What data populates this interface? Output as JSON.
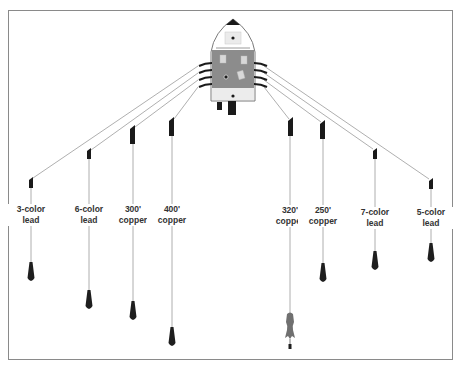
{
  "diagram": {
    "title": "",
    "colors": {
      "line": "#9a9a9a",
      "weight": "#1e1e1e",
      "board": "#1a1a1a",
      "boat_hull": "#ffffff",
      "boat_deck": "#8c8c8c",
      "border": "#8a8a8a"
    },
    "lines": [
      {
        "id": "3-color-lead",
        "label_line1": "3-color",
        "label_line2": "lead",
        "x": 31,
        "board_y": 177,
        "label_y": 205,
        "weight_y": 262,
        "side": "port"
      },
      {
        "id": "6-color-lead",
        "label_line1": "6-color",
        "label_line2": "lead",
        "x": 89,
        "board_y": 148,
        "label_y": 205,
        "weight_y": 290,
        "side": "port"
      },
      {
        "id": "300-copper",
        "label_line1": "300'",
        "label_line2": "copper",
        "x": 133,
        "board_y": 126,
        "label_y": 205,
        "weight_y": 301,
        "side": "port"
      },
      {
        "id": "400-copper",
        "label_line1": "400'",
        "label_line2": "copper",
        "x": 172,
        "board_y": 118,
        "label_y": 205,
        "weight_y": 327,
        "side": "port"
      },
      {
        "id": "320-copper",
        "label_line1": "320'",
        "label_line2": "copper",
        "x": 291,
        "board_y": 118,
        "label_y": 205,
        "weight_y": 313,
        "side": "starboard",
        "weight_shape": "fish"
      },
      {
        "id": "250-copper",
        "label_line1": "250'",
        "label_line2": "copper",
        "x": 323,
        "board_y": 121,
        "label_y": 205,
        "weight_y": 263,
        "side": "starboard"
      },
      {
        "id": "7-color-lead",
        "label_line1": "7-color",
        "label_line2": "lead",
        "x": 375,
        "board_y": 148,
        "label_y": 207,
        "weight_y": 251,
        "side": "starboard"
      },
      {
        "id": "5-color-lead",
        "label_line1": "5-color",
        "label_line2": "lead",
        "x": 431,
        "board_y": 178,
        "label_y": 207,
        "weight_y": 243,
        "side": "starboard"
      }
    ],
    "boat": {
      "label": "",
      "center_x": 233,
      "bow_y": 18,
      "stern_y": 100
    }
  }
}
